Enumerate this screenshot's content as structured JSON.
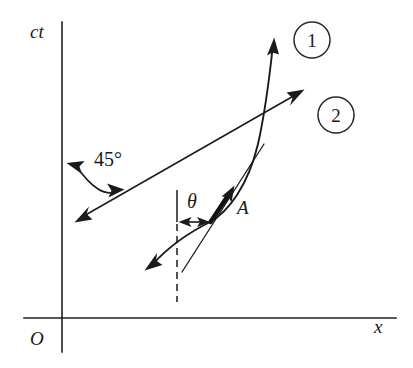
{
  "figure": {
    "kind": "spacetime-diagram",
    "background_color": "#ffffff",
    "ink_color": "#1a1a1a",
    "width": 413,
    "height": 368
  },
  "axes": {
    "vertical": {
      "label": "ct",
      "label_x": 30,
      "label_y": 38,
      "x": 62,
      "y_top": 22,
      "y_bottom": 352
    },
    "horizontal": {
      "label": "x",
      "label_x": 374,
      "label_y": 333,
      "y": 318,
      "x_left": 24,
      "x_right": 396
    },
    "origin": {
      "label": "O",
      "label_x": 30,
      "label_y": 345
    }
  },
  "badges": [
    {
      "name": "badge-one",
      "label": "1",
      "cx": 312,
      "cy": 40,
      "r": 18
    },
    {
      "name": "badge-two",
      "label": "2",
      "cx": 336,
      "cy": 115,
      "r": 18
    }
  ],
  "annotations": {
    "angle_45": {
      "label": "45°",
      "label_x": 94,
      "label_y": 166,
      "arc_start": [
        68,
        164
      ],
      "arc_end": [
        124,
        189
      ]
    },
    "theta": {
      "label": "θ",
      "label_x": 187,
      "label_y": 208,
      "arrow_y": 222,
      "arrow_x_left": 179,
      "arrow_x_right": 209
    },
    "four_vector": {
      "label": "A",
      "label_x": 237,
      "label_y": 214,
      "tail": [
        210,
        222
      ],
      "tip": [
        234,
        186
      ]
    }
  },
  "lines": {
    "ray_two": {
      "name": "light-like-ray-2",
      "from": [
        75,
        222
      ],
      "to": [
        304,
        90
      ],
      "double_arrow": true
    },
    "worldline_one": {
      "name": "curved-worldline-1",
      "arrow_tip": [
        274,
        38
      ],
      "arrow_tail": [
        145,
        270
      ],
      "double_arrow": true
    },
    "tangent": {
      "name": "tangent-line-at-A",
      "from": [
        182,
        272
      ],
      "to": [
        264,
        144
      ]
    },
    "vertical_reference": {
      "name": "vertical-reference-line",
      "x": 177,
      "solid_top": 190,
      "solid_bottom": 222,
      "dashed_top": 222,
      "dashed_bottom": 302
    }
  }
}
